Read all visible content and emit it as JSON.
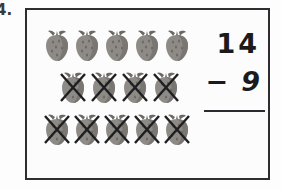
{
  "problem": {
    "number_label": "4.",
    "type": "subtraction-with-picture-model"
  },
  "equation": {
    "minuend": "14",
    "operator": "−",
    "subtrahend": "9",
    "answer": "",
    "answer_line_visible": true
  },
  "picture_model": {
    "icon_name": "strawberry-icon",
    "cross_icon_name": "cross-out-x-icon",
    "total_count": 14,
    "crossed_out_count": 9,
    "remaining_count": 5,
    "rows": [
      {
        "row_index": 1,
        "count": 5,
        "crossed_out": [
          false,
          false,
          false,
          false,
          false
        ]
      },
      {
        "row_index": 2,
        "count": 4,
        "crossed_out": [
          true,
          true,
          true,
          true
        ]
      },
      {
        "row_index": 3,
        "count": 5,
        "crossed_out": [
          true,
          true,
          true,
          true,
          true
        ]
      }
    ]
  },
  "colors": {
    "border": "#2e2e32",
    "ink": "#1b1b1e",
    "berry_body": "#8e8a86",
    "berry_body_shadow": "#6f6b68",
    "berry_stem": "#6b6864",
    "cross_stroke": "#1f1f22",
    "page_background": "#fdfdfd",
    "box_background": "#fcfcfc"
  }
}
